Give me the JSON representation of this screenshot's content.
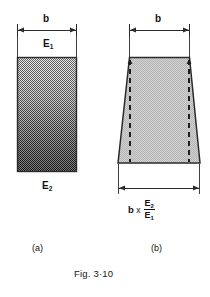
{
  "figure": {
    "caption": "Fig. 3·10",
    "panels": [
      {
        "id": "a",
        "sublabel": "(a)",
        "shape": "rectangle",
        "shading": "vertical-gradient-light-to-dark",
        "top_dimension_label": "b",
        "top_material_label": "E",
        "top_material_sub": "1",
        "bottom_material_label": "E",
        "bottom_material_sub": "2"
      },
      {
        "id": "b",
        "sublabel": "(b)",
        "shape": "trapezoid",
        "shading": "uniform-halftone",
        "top_dimension_label": "b",
        "bottom_dimension": {
          "base": "b",
          "operator": "x",
          "numerator": "E",
          "numerator_sub": "2",
          "denominator": "E",
          "denominator_sub": "1"
        },
        "internal_guides": "dashed-vertical-lines"
      }
    ]
  },
  "colors": {
    "background": "#ffffff",
    "ink": "#131313",
    "line": "#2b2b2b",
    "fill_light": "#e2e2e2",
    "fill_mid": "#b9b9b9",
    "fill_dark": "#4a4a4a",
    "trapezoid_fill": "#c9c9c9"
  }
}
